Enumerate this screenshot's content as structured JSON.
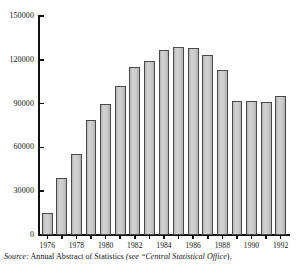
{
  "chart_data": {
    "type": "bar",
    "title": "",
    "subtitle": "",
    "xlabel": "",
    "ylabel": "",
    "ylim": [
      0,
      150000
    ],
    "grid": false,
    "legend": null,
    "y_ticks": [
      0,
      30000,
      60000,
      90000,
      120000,
      150000
    ],
    "y_tick_labels": [
      "0",
      "30000",
      "60000",
      "90000",
      "120000",
      "150000"
    ],
    "x_tick_labels": [
      "1976",
      "1978",
      "1980",
      "1982",
      "1984",
      "1986",
      "1988",
      "1990",
      "1992"
    ],
    "categories": [
      "1976",
      "1977",
      "1978",
      "1979",
      "1980",
      "1981",
      "1982",
      "1983",
      "1984",
      "1985",
      "1986",
      "1987",
      "1988",
      "1989",
      "1990",
      "1991",
      "1992"
    ],
    "values": [
      15000,
      39000,
      55500,
      79000,
      89500,
      102000,
      115000,
      119000,
      127000,
      128500,
      128000,
      123500,
      113000,
      91500,
      91500,
      91000,
      95000
    ],
    "bar_color": "#c6c6c6",
    "bar_edge_color": "#4a4a4a",
    "axis_color": "#111111"
  },
  "caption": {
    "source_label": "Source:",
    "source_text": "Annual Abstract of Statistics",
    "see_label": "(see",
    "reference": "“Central Statistical Office",
    "tail": ")."
  }
}
